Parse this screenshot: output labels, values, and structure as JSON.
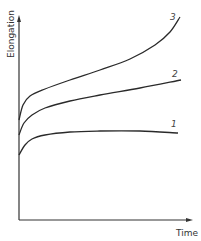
{
  "chart_data": {
    "type": "line",
    "title": "",
    "xlabel": "Time",
    "ylabel": "Elongation",
    "grid": false,
    "legend": "inline curve labels at line ends",
    "x_ticks": [],
    "y_ticks": [],
    "series": [
      {
        "name": "1",
        "description": "Low-load creep curve: quick initial elongation then nearly constant",
        "points_px": [
          [
            19,
            155
          ],
          [
            25,
            145
          ],
          [
            32,
            139
          ],
          [
            45,
            135
          ],
          [
            70,
            132
          ],
          [
            100,
            131
          ],
          [
            140,
            131
          ],
          [
            178,
            133
          ]
        ]
      },
      {
        "name": "2",
        "description": "Medium load: initial elongation then steady linear increase",
        "points_px": [
          [
            19,
            135
          ],
          [
            24,
            123
          ],
          [
            32,
            115
          ],
          [
            45,
            108
          ],
          [
            70,
            101
          ],
          [
            100,
            95
          ],
          [
            140,
            88
          ],
          [
            181,
            80
          ]
        ]
      },
      {
        "name": "3",
        "description": "High load: initial elongation, steady increase, then accelerating (tertiary creep)",
        "points_px": [
          [
            19,
            120
          ],
          [
            23,
            105
          ],
          [
            30,
            96
          ],
          [
            45,
            89
          ],
          [
            70,
            80
          ],
          [
            100,
            70
          ],
          [
            130,
            59
          ],
          [
            155,
            45
          ],
          [
            170,
            32
          ],
          [
            180,
            17
          ]
        ]
      }
    ]
  },
  "labels": {
    "x_axis": "Time",
    "y_axis": "Elongation",
    "curve_1": "1",
    "curve_2": "2",
    "curve_3": "3"
  },
  "colors": {
    "line": "#2a2a2a",
    "axis": "#333333",
    "background": "#ffffff"
  }
}
